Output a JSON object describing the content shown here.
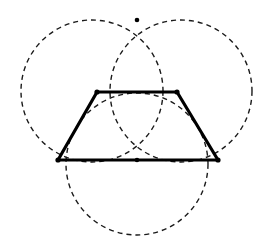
{
  "figure": {
    "canvas": {
      "width": 275,
      "height": 247,
      "background": "#ffffff"
    },
    "stroke_colors": {
      "construction": "#1a1a1a",
      "shape": "#000000",
      "vertex": "#000000"
    }
  },
  "chart_data": {
    "type": "diagram",
    "xlabel": "",
    "ylabel": "",
    "xlim": [
      0,
      275
    ],
    "ylim": [
      0,
      247
    ],
    "grid": false,
    "legend": "none",
    "circles": [
      {
        "name": "upper-left-circle",
        "cx": 92,
        "cy": 91,
        "r": 71,
        "style": "dashed",
        "stroke": "#1a1a1a",
        "stroke_width": 1.4,
        "dash": "5 4"
      },
      {
        "name": "upper-right-circle",
        "cx": 181,
        "cy": 91,
        "r": 71,
        "style": "dashed",
        "stroke": "#1a1a1a",
        "stroke_width": 1.4,
        "dash": "5 4"
      },
      {
        "name": "lower-center-circle",
        "cx": 137,
        "cy": 164,
        "r": 71,
        "style": "dashed",
        "stroke": "#1a1a1a",
        "stroke_width": 1.4,
        "dash": "5 4"
      }
    ],
    "polygon": {
      "name": "trapezoid",
      "closed": false,
      "stroke": "#000000",
      "stroke_width": 3.2,
      "vertices": [
        {
          "label": "bottom-left",
          "x": 58,
          "y": 160
        },
        {
          "label": "top-left",
          "x": 97,
          "y": 92
        },
        {
          "label": "top-right",
          "x": 177,
          "y": 92
        },
        {
          "label": "bottom-right",
          "x": 218,
          "y": 160
        }
      ],
      "edges": [
        {
          "name": "left-leg",
          "from": "bottom-left",
          "to": "top-left"
        },
        {
          "name": "top-base",
          "from": "top-left",
          "to": "top-right"
        },
        {
          "name": "right-leg",
          "from": "top-right",
          "to": "bottom-right"
        },
        {
          "name": "bottom-base",
          "from": "bottom-left",
          "to": "bottom-right"
        }
      ]
    },
    "points": [
      {
        "name": "top-intersection-point",
        "x": 137,
        "y": 20,
        "r": 2.3
      },
      {
        "name": "center-baseline-point",
        "x": 137,
        "y": 160,
        "r": 2.3
      },
      {
        "name": "trapezoid-bottom-left-point",
        "x": 58,
        "y": 160,
        "r": 2.6
      },
      {
        "name": "trapezoid-bottom-right-point",
        "x": 218,
        "y": 160,
        "r": 2.6
      },
      {
        "name": "trapezoid-top-left-point",
        "x": 97,
        "y": 92,
        "r": 2.6
      },
      {
        "name": "trapezoid-top-right-point",
        "x": 177,
        "y": 92,
        "r": 2.6
      }
    ]
  }
}
